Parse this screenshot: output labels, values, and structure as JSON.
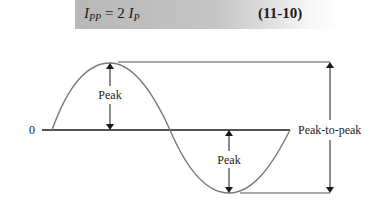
{
  "equation": {
    "lhs_symbol": "I",
    "lhs_subscript": "PP",
    "operator": "=",
    "coefficient": "2",
    "rhs_symbol": "I",
    "rhs_subscript": "P",
    "number": "(11-10)"
  },
  "diagram": {
    "zero_label": "0",
    "peak_label_upper": "Peak",
    "peak_label_lower": "Peak",
    "peak_to_peak_label": "Peak-to-peak",
    "colors": {
      "waveform": "#7a7a7a",
      "axis": "#1a1a1a",
      "reference_lines": "#555555",
      "banner": "#bdbdbd"
    }
  }
}
